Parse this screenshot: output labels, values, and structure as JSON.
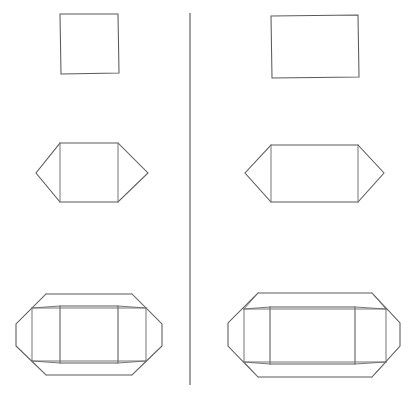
{
  "figure": {
    "background_color": "#ffffff",
    "stroke_color": "#5a5a5a",
    "fold_stroke_color": "#6e6e6e",
    "divider_color": "#555555",
    "width": 417,
    "height": 395,
    "columns": [
      {
        "name": "left-column",
        "base_shape": "square"
      },
      {
        "name": "right-column",
        "base_shape": "rectangle"
      }
    ],
    "rows": [
      {
        "name": "row-1-base-face",
        "description": "plain quadrilateral face"
      },
      {
        "name": "row-2-two-flaps",
        "description": "face with two triangular side flaps forming a hexagon"
      },
      {
        "name": "row-3-full-net",
        "description": "face with four trapezoidal flaps and diagonal corner fold lines"
      }
    ]
  },
  "divider": {
    "name": "vertical-divider",
    "x": 190,
    "y_top": 13,
    "y_bottom": 385
  },
  "shapes": {
    "left_row1_square": {
      "label": "square",
      "points": "60,14 118,14 119,73 61,74 60,14"
    },
    "right_row1_rect": {
      "label": "rectangle",
      "points": "271,16 358,15 359,77 272,78 271,16"
    },
    "left_row2_hexagon": {
      "label": "square-with-side-triangles",
      "outline": "60,143 118,143 148,173 118,202 60,202 36,173 60,143",
      "fold_left": "60,143 60,202",
      "fold_right": "118,143 118,202"
    },
    "right_row2_hexagon": {
      "label": "rectangle-with-side-triangles",
      "outline": "271,145 358,145 384,173 358,202 271,202 245,173 271,145",
      "fold_left": "271,145 271,202",
      "fold_right": "358,145 358,202"
    },
    "left_row3_net": {
      "label": "square-full-net",
      "inner_face": "60,306 118,306 118,363 60,363 60,306",
      "outer_outline": "46,294 132,294 162,324 162,346 132,375 46,375 16,346 16,324 46,294",
      "diag_upper_left": "16,324 46,294",
      "diag_lower_left": "16,346 46,375",
      "diag_upper_right": "132,294 162,324",
      "diag_lower_right": "162,346 132,375",
      "flap_fold_top": "32,308 146,308",
      "flap_fold_bottom": "32,361 146,361",
      "flap_fold_left": "32,308 32,361",
      "flap_fold_right": "146,308 146,361",
      "corner_tl": "46,294 32,308",
      "corner_tr": "132,294 146,308",
      "corner_bl": "46,375 32,361",
      "corner_br": "132,375 146,361",
      "inner_diag_tl": "60,306 32,308",
      "inner_diag_tr": "118,306 146,308",
      "inner_diag_bl": "60,363 32,361",
      "inner_diag_br": "118,363 146,361"
    },
    "right_row3_net": {
      "label": "rectangle-full-net",
      "inner_face": "270,307 355,307 355,364 270,364 270,307",
      "outer_outline": "258,293 372,293 400,323 400,346 372,377 258,377 228,346 228,323 258,293",
      "diag_upper_left": "228,323 258,293",
      "diag_lower_left": "228,346 258,377",
      "diag_upper_right": "372,293 400,323",
      "diag_lower_right": "400,346 372,377",
      "flap_fold_top": "244,309 386,309",
      "flap_fold_bottom": "244,362 386,362",
      "flap_fold_left": "244,309 244,362",
      "flap_fold_right": "386,309 386,362",
      "corner_tl": "258,293 244,309",
      "corner_tr": "372,293 386,309",
      "corner_bl": "258,377 244,362",
      "corner_br": "372,377 386,362",
      "inner_diag_tl": "270,307 244,309",
      "inner_diag_tr": "355,307 386,309",
      "inner_diag_bl": "270,364 244,362",
      "inner_diag_br": "355,364 386,362"
    }
  }
}
